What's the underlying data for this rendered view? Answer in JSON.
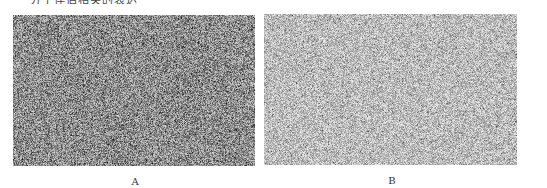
{
  "figure": {
    "caption_partial": "分子伴侣相关的表达",
    "panels": [
      {
        "label": "A",
        "description": "histology micrograph, dense dark-stained cells",
        "tone": "#6d6d6d"
      },
      {
        "label": "B",
        "description": "histology micrograph, lighter-stained tissue",
        "tone": "#9a9a9a"
      }
    ]
  }
}
